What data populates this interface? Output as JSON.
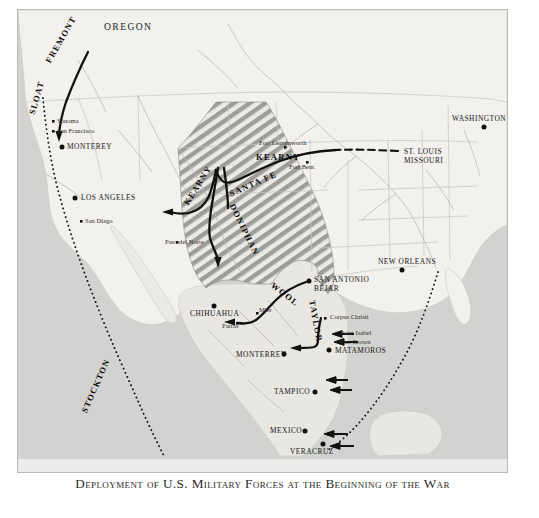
{
  "caption": {
    "text": "Deployment of U.S. Military Forces at the Beginning of the War"
  },
  "colors": {
    "ocean": "#d0d0ce",
    "land": "#f2f1ee",
    "land_mexico": "#e8e7e3",
    "disputed_hatch": "#9a9a97",
    "route_line": "#111111",
    "frame": "#b9b9b9",
    "caption_band": "#ececea"
  },
  "map": {
    "regions": [
      {
        "name": "oregon",
        "label": "OREGON",
        "x": 86,
        "y": 12
      }
    ],
    "commanders": [
      {
        "name": "fremont",
        "label": "FREMONT",
        "x": 33,
        "y": 52,
        "rotate": -62
      },
      {
        "name": "sloat",
        "label": "SLOAT",
        "x": 12,
        "y": 102,
        "rotate": -74
      },
      {
        "name": "stockton",
        "label": "STOCKTON",
        "x": 83,
        "y": 385,
        "rotate": -69
      },
      {
        "name": "kearny",
        "label": "KEARNY",
        "x": 182,
        "y": 188,
        "rotate": -56
      },
      {
        "name": "kearny2",
        "label": "KEARNY",
        "x": 386,
        "y": 142,
        "rotate": 0
      },
      {
        "name": "santa-fe",
        "label": "SANTA FE",
        "x": 222,
        "y": 184,
        "rotate": -30
      },
      {
        "name": "doniphan",
        "label": "DONIPHAN",
        "x": 235,
        "y": 190,
        "rotate": 62
      },
      {
        "name": "wool",
        "label": "WOOL",
        "x": 258,
        "y": 272,
        "rotate": 38
      },
      {
        "name": "taylor",
        "label": "TAYLOR",
        "x": 294,
        "y": 285,
        "rotate": 78
      }
    ],
    "cities_major": [
      {
        "name": "monterey-ca",
        "label": "MONTEREY",
        "x": 39,
        "y": 134,
        "dx": 44,
        "dy": 137
      },
      {
        "name": "los-angeles",
        "label": "LOS ANGELES",
        "x": 63,
        "y": 185,
        "dx": 57,
        "dy": 188
      },
      {
        "name": "chihuahua",
        "label": "CHIHUAHUA",
        "x": 176,
        "y": 295,
        "dx": 196,
        "dy": 287
      },
      {
        "name": "san-antonio",
        "label": "SAN ANTONIO",
        "x": 296,
        "y": 268,
        "dx": 291,
        "dy": 271
      },
      {
        "name": "bejar",
        "label": "BÉJAR",
        "x": 296,
        "y": 276,
        "dx": -1,
        "dy": -1
      },
      {
        "name": "matamoros",
        "label": "MATAMOROS",
        "x": 317,
        "y": 338,
        "dx": 311,
        "dy": 340
      },
      {
        "name": "monterrey-mx",
        "label": "MONTERREY",
        "x": 271,
        "y": 341,
        "dx": 266,
        "dy": 344
      },
      {
        "name": "tampico",
        "label": "TAMPICO",
        "x": 302,
        "y": 379,
        "dx": 297,
        "dy": 382
      },
      {
        "name": "mexico",
        "label": "MEXICO",
        "x": 292,
        "y": 418,
        "dx": 287,
        "dy": 421
      },
      {
        "name": "veracruz",
        "label": "VERACRUZ",
        "x": 297,
        "y": 440,
        "dx": 310,
        "dy": 432
      },
      {
        "name": "new-orleans",
        "label": "NEW ORLEANS",
        "x": 377,
        "y": 249,
        "dx": 384,
        "dy": 260
      },
      {
        "name": "washington",
        "label": "WASHINGTON",
        "x": 466,
        "y": 106,
        "dx": 513,
        "dy": 117
      },
      {
        "name": "st-louis",
        "label": "ST. LOUIS",
        "x": 386,
        "y": 142,
        "dx": 380,
        "dy": 141
      },
      {
        "name": "missouri",
        "label": "MISSOURI",
        "x": 386,
        "y": 150,
        "dx": -1,
        "dy": -1
      }
    ],
    "cities_minor": [
      {
        "name": "sonoma",
        "label": "Sonoma",
        "x": 39,
        "y": 110,
        "dx": 34,
        "dy": 112
      },
      {
        "name": "san-francisco",
        "label": "San Francisco",
        "x": 39,
        "y": 120,
        "dx": 34,
        "dy": 122
      },
      {
        "name": "san-diego",
        "label": "San Diego",
        "x": 67,
        "y": 209,
        "dx": 62,
        "dy": 211
      },
      {
        "name": "paso-del-norte",
        "label": "Paso del Norte",
        "x": 164,
        "y": 230,
        "dx": 158,
        "dy": 232
      },
      {
        "name": "fort-leavenworth",
        "label": "Fort Leavenworth",
        "x": 268,
        "y": 131,
        "dx": -1,
        "dy": -1
      },
      {
        "name": "fort-bent",
        "label": "Fort Bent",
        "x": 290,
        "y": 157,
        "dx": -1,
        "dy": -1
      },
      {
        "name": "corpus-christi",
        "label": "Corpus Christi",
        "x": 312,
        "y": 306,
        "dx": 307,
        "dy": 308
      },
      {
        "name": "point-isabel",
        "label": "Point Isabel",
        "x": 317,
        "y": 322,
        "dx": -1,
        "dy": -1
      },
      {
        "name": "fort-brown",
        "label": "Fort Brown",
        "x": 317,
        "y": 330,
        "dx": -1,
        "dy": -1
      },
      {
        "name": "mier",
        "label": "Mier",
        "x": 240,
        "y": 300,
        "dx": -1,
        "dy": -1
      },
      {
        "name": "parras",
        "label": "Parras",
        "x": 212,
        "y": 315,
        "dx": -1,
        "dy": -1
      }
    ]
  }
}
